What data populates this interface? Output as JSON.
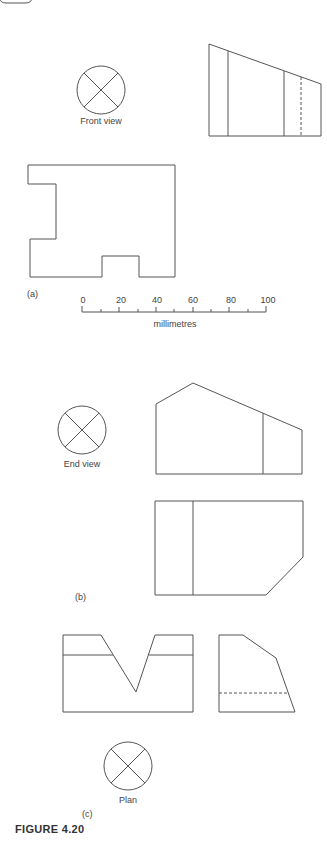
{
  "figure": {
    "caption": "FIGURE 4.20",
    "colors": {
      "stroke": "#555555",
      "text": "#444444",
      "background": "#ffffff"
    }
  },
  "part_a": {
    "label": "(a)",
    "symbol_label": "Front view",
    "symbol_icon": "circle-cross-icon"
  },
  "scale_bar": {
    "unit_label": "millimetres",
    "ticks": [
      "0",
      "20",
      "40",
      "60",
      "80",
      "100"
    ],
    "min": 0,
    "max": 100,
    "minor_step": 10
  },
  "part_b": {
    "label": "(b)",
    "symbol_label": "End view",
    "symbol_icon": "circle-cross-icon"
  },
  "part_c": {
    "label": "(c)",
    "symbol_label": "Plan",
    "symbol_icon": "circle-cross-icon"
  }
}
